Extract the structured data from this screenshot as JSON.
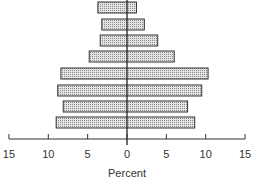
{
  "chart_data": {
    "type": "bar",
    "orientation": "horizontal",
    "subtype": "population-pyramid",
    "title": "",
    "xlabel": "Percent",
    "ylabel": "",
    "xlim": [
      -15,
      15
    ],
    "x_ticks": [
      -15,
      -10,
      -5,
      0,
      5,
      10,
      15
    ],
    "x_tick_labels": [
      "15",
      "10",
      "5",
      "0",
      "5",
      "10",
      "15"
    ],
    "grid": false,
    "legend": null,
    "categories": [
      "row1 (top)",
      "row2",
      "row3",
      "row4",
      "row5",
      "row6",
      "row7",
      "row8 (bottom)"
    ],
    "series": [
      {
        "name": "left",
        "values": [
          3.7,
          3.2,
          3.4,
          4.8,
          8.4,
          8.8,
          8.1,
          9.0
        ]
      },
      {
        "name": "right",
        "values": [
          1.2,
          2.2,
          3.9,
          6.0,
          10.3,
          9.5,
          7.7,
          8.6
        ]
      }
    ],
    "fill_pattern": "dotted-gray"
  },
  "axis": {
    "label": "Percent",
    "ticks": [
      "15",
      "10",
      "5",
      "0",
      "5",
      "10",
      "15"
    ]
  }
}
